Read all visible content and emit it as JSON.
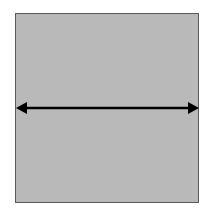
{
  "diagram": {
    "shape": "square",
    "fill_color": "#b9b9b9",
    "border_color": "#5a5a5a",
    "arrow": {
      "type": "double-headed-horizontal",
      "color": "#000000"
    }
  }
}
